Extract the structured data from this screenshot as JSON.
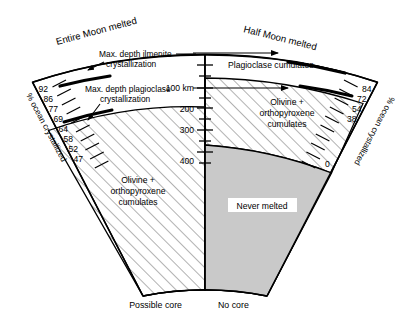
{
  "figure": {
    "type": "cross-section-diagram"
  },
  "titles": {
    "left": "Entire Moon melted",
    "right": "Half Moon melted"
  },
  "annotations": {
    "ilmenite_line1": "Max. depth ilmenite",
    "ilmenite_line2": "crystallization",
    "plagioclase_line1": "Max. depth plagioclase",
    "plagioclase_line2": "crystallization"
  },
  "regions": {
    "plagioclase_cumulates": "Plagioclase cumulates",
    "olivine_opx_right_l1": "Olivine +",
    "olivine_opx_right_l2": "orthopyroxene",
    "olivine_opx_right_l3": "cumulates",
    "olivine_opx_left_l1": "Olivine +",
    "olivine_opx_left_l2": "orthopyroxene",
    "olivine_opx_left_l3": "cumulates",
    "never_melted": "Never melted"
  },
  "bottom_labels": {
    "left": "Possible core",
    "right": "No core"
  },
  "depth_axis": {
    "label_unit": "100 km",
    "ticks": [
      "100 km",
      "200",
      "300",
      "400"
    ],
    "values": [
      100,
      200,
      300,
      400
    ]
  },
  "left_axis": {
    "title": "% ocean crystallized",
    "labels": [
      "92",
      "86",
      "77",
      "69",
      "64",
      "58",
      "52",
      "47"
    ],
    "values": [
      92,
      86,
      77,
      69,
      64,
      58,
      52,
      47
    ]
  },
  "right_axis": {
    "title": "% ocean crystallized",
    "labels": [
      "84",
      "72",
      "54",
      "38",
      "0"
    ],
    "values": [
      84,
      72,
      54,
      38,
      0
    ]
  },
  "colors": {
    "never_melted_fill": "#c9c9c9",
    "outline": "#000000",
    "hatch": "#555555",
    "background": "#ffffff"
  }
}
